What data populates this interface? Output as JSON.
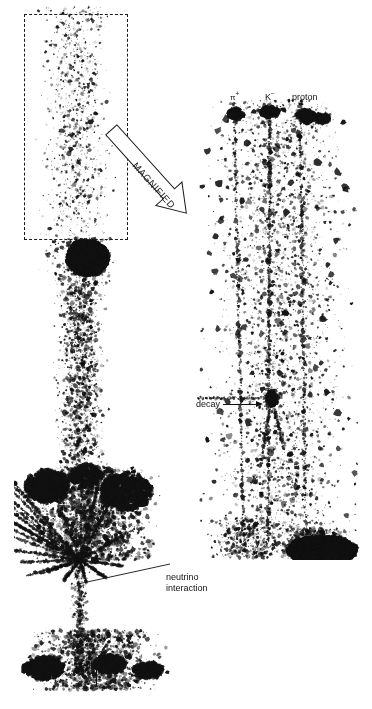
{
  "figure": {
    "background_color": "#ffffff",
    "ink_color": "#111111",
    "width": 372,
    "height": 709
  },
  "magnify": {
    "box_label": "magnified-region-box",
    "arrow_label": "MAGNIFIED"
  },
  "right_panel": {
    "track_labels": [
      {
        "id": "pi",
        "text": "π",
        "superscript": "+"
      },
      {
        "id": "k",
        "text": "K",
        "superscript": "−"
      },
      {
        "id": "proton",
        "text": "proton",
        "superscript": ""
      }
    ],
    "decay": {
      "label": "decay"
    }
  },
  "left_panel": {
    "interaction": {
      "line1": "neutrino",
      "line2": "interaction"
    },
    "beam": {
      "label": "neutrino"
    }
  },
  "caption": {
    "text": ""
  },
  "panels": {
    "left_strip": {
      "name": "left-emulsion-strip",
      "x": 14,
      "y": 0,
      "width": 164,
      "height": 700
    },
    "right_strip": {
      "name": "right-emulsion-strip",
      "x": 196,
      "y": 98,
      "width": 166,
      "height": 462
    }
  }
}
